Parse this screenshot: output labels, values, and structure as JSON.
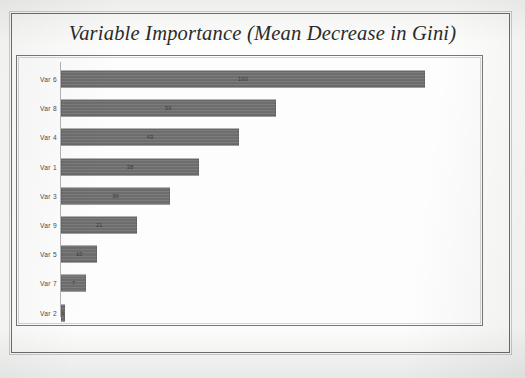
{
  "chart_title": "Variable Importance (Mean Decrease in Gini)",
  "chart_data": {
    "type": "bar",
    "orientation": "horizontal",
    "title": "Variable Importance (Mean Decrease in Gini)",
    "xlabel": "",
    "ylabel": "",
    "grid": false,
    "legend": false,
    "xlim": [
      0,
      100
    ],
    "categories": [
      "Var 6",
      "Var 8",
      "Var 4",
      "Var 1",
      "Var 3",
      "Var 9",
      "Var 5",
      "Var 7",
      "Var 2"
    ],
    "values": [
      100,
      59,
      49,
      38,
      30,
      21,
      10,
      7,
      1
    ],
    "bar_color": "#6d6d6d",
    "axis_color": "#b4b4b4",
    "frame_color": "#777777",
    "title_color": "#2b2b2b",
    "background": "#fdfdfd"
  }
}
